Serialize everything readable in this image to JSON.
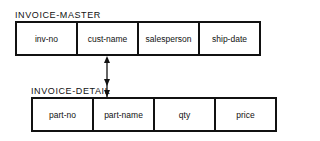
{
  "master": {
    "title": "INVOICE-MASTER",
    "fields": [
      "inv-no",
      "cust-name",
      "salesperson",
      "ship-date"
    ]
  },
  "detail": {
    "title": "INVOICE-DETAIL",
    "fields": [
      "part-no",
      "part-name",
      "qty",
      "price"
    ]
  },
  "relationship": {
    "from": "cust-name",
    "to": "part-name",
    "type": "one-to-many"
  }
}
